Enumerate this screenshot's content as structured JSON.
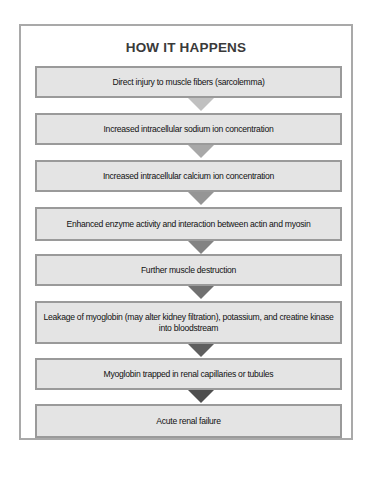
{
  "title": "HOW IT HAPPENS",
  "steps": [
    {
      "label": "Direct injury to muscle fibers (sarcolemma)"
    },
    {
      "label": "Increased intracellular sodium ion concentration"
    },
    {
      "label": "Increased intracellular calcium ion concentration"
    },
    {
      "label": "Enhanced enzyme activity and interaction between actin and myosin"
    },
    {
      "label": "Further muscle destruction"
    },
    {
      "label": "Leakage of myoglobin (may alter kidney filtration), potassium, and creatine kinase into bloodstream"
    },
    {
      "label": "Myoglobin trapped in renal capillaries or tubules"
    },
    {
      "label": "Acute renal failure"
    }
  ],
  "colors": {
    "box_fill": "#e4e4e4",
    "box_border": "#9a9a9a",
    "frame_border": "#a9a9a9",
    "arrows": [
      "#c0c0c0",
      "#a8a8a8",
      "#959595",
      "#838383",
      "#707070",
      "#5e5e5e",
      "#4e4e4e"
    ]
  }
}
